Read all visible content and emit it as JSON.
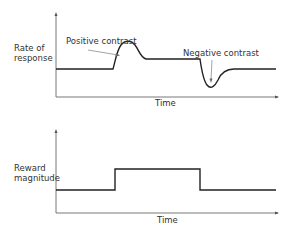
{
  "top_chart": {
    "ylabel_line1": "Rate of",
    "ylabel_line2": "response",
    "xlabel": "Time",
    "annotation_positive": "Positive contrast",
    "annotation_negative": "Negative contrast"
  },
  "bottom_chart": {
    "ylabel_line1": "Reward",
    "ylabel_line2": "magnitude",
    "xlabel": "Time"
  },
  "colors": {
    "line": "#222222",
    "axis": "#555555",
    "text": "#333333"
  }
}
